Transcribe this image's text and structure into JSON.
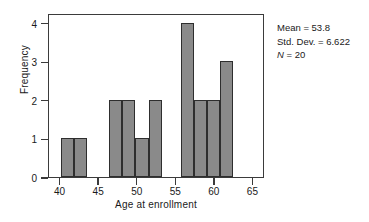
{
  "chart_data": {
    "type": "bar",
    "title": "",
    "subtitle": "",
    "xlabel": "Age at enrollment",
    "ylabel": "Frequency",
    "xlim": [
      38.5,
      66.5
    ],
    "ylim": [
      0,
      4.25
    ],
    "xticks": [
      40,
      45,
      50,
      55,
      60,
      65
    ],
    "yticks": [
      0,
      1,
      2,
      3,
      4
    ],
    "grid": false,
    "legend": null,
    "bin_width": 1.7,
    "bins": [
      {
        "label": "40.0-41.7",
        "x_start": 40.0,
        "x_end": 41.7,
        "value": 1
      },
      {
        "label": "41.7-43.4",
        "x_start": 41.7,
        "x_end": 43.4,
        "value": 1
      },
      {
        "label": "46.3-48.0",
        "x_start": 46.3,
        "x_end": 48.0,
        "value": 2
      },
      {
        "label": "48.0-49.7",
        "x_start": 48.0,
        "x_end": 49.7,
        "value": 2
      },
      {
        "label": "49.7-51.4",
        "x_start": 49.7,
        "x_end": 51.4,
        "value": 1
      },
      {
        "label": "51.4-53.1",
        "x_start": 51.4,
        "x_end": 53.1,
        "value": 2
      },
      {
        "label": "55.6-57.3",
        "x_start": 55.6,
        "x_end": 57.3,
        "value": 4
      },
      {
        "label": "57.3-59.0",
        "x_start": 57.3,
        "x_end": 59.0,
        "value": 2
      },
      {
        "label": "59.0-60.7",
        "x_start": 59.0,
        "x_end": 60.7,
        "value": 2
      },
      {
        "label": "60.7-62.4",
        "x_start": 60.7,
        "x_end": 62.4,
        "value": 3
      }
    ],
    "values": [
      1,
      1,
      2,
      2,
      1,
      2,
      4,
      2,
      2,
      3
    ],
    "bar_color": "#8a8a8a",
    "bar_edge_color": "#2e2e2e"
  },
  "stats": {
    "mean_label": "Mean = 53.8",
    "std_dev_label": "Std. Dev. = 6.622",
    "n_symbol": "N",
    "n_value": " = 20"
  }
}
